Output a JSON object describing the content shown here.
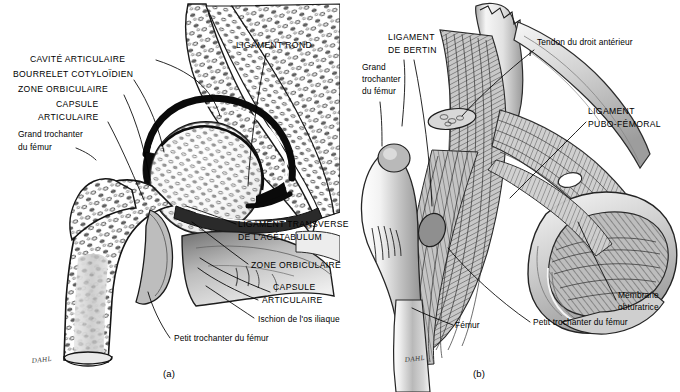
{
  "figure": {
    "background_color": "#ffffff",
    "ink_color": "#000000",
    "style": "grayscale medical line illustration, stipple and hatch shading",
    "signature": "DAHL"
  },
  "panels": [
    {
      "id": "a",
      "letter": "(a)",
      "view": "frontal cross-section of the hip joint (coxo-femoral articulation)",
      "labels": [
        {
          "name": "cavite-articulaire",
          "text": "CAVITÉ ARTICULAIRE",
          "style": "caps",
          "x": 30,
          "y": 62,
          "anchor": "start"
        },
        {
          "name": "bourrelet-cotyloidien",
          "text": "BOURRELET COTYLOÏDIEN",
          "style": "caps",
          "x": 13,
          "y": 77,
          "anchor": "start"
        },
        {
          "name": "zone-orbiculaire-left",
          "text": "ZONE ORBICULAIRE",
          "style": "caps",
          "x": 18,
          "y": 92,
          "anchor": "start"
        },
        {
          "name": "capsule-left-line1",
          "text": "CAPSULE",
          "style": "caps",
          "x": 56,
          "y": 107,
          "anchor": "start"
        },
        {
          "name": "capsule-left-line2",
          "text": "ARTICULAIRE",
          "style": "caps",
          "x": 38,
          "y": 120,
          "anchor": "start"
        },
        {
          "name": "grand-trochanter-left-line1",
          "text": "Grand trochanter",
          "style": "small",
          "x": 18,
          "y": 137,
          "anchor": "start"
        },
        {
          "name": "grand-trochanter-left-line2",
          "text": "du fémur",
          "style": "small",
          "x": 18,
          "y": 150,
          "anchor": "start"
        },
        {
          "name": "ligament-rond",
          "text": "LIGAMENT ROND",
          "style": "caps",
          "x": 236,
          "y": 48,
          "anchor": "start"
        },
        {
          "name": "ligament-transverse-line1",
          "text": "LIGAMENT TRANSVERSE",
          "style": "caps",
          "x": 238,
          "y": 227,
          "anchor": "start"
        },
        {
          "name": "ligament-transverse-line2",
          "text": "DE L'ACÉTABULUM",
          "style": "caps",
          "x": 238,
          "y": 240,
          "anchor": "start"
        },
        {
          "name": "zone-orbiculaire-lower",
          "text": "ZONE ORBICULAIRE",
          "style": "caps",
          "x": 251,
          "y": 268,
          "anchor": "start"
        },
        {
          "name": "capsule-lower-line1",
          "text": "CAPSULE",
          "style": "caps",
          "x": 273,
          "y": 290,
          "anchor": "start"
        },
        {
          "name": "capsule-lower-line2",
          "text": "ARTICULAIRE",
          "style": "caps",
          "x": 262,
          "y": 303,
          "anchor": "start"
        },
        {
          "name": "ischion-os-iliaque",
          "text": "Ischion de l'os iliaque",
          "style": "small",
          "x": 258,
          "y": 322,
          "anchor": "start"
        },
        {
          "name": "petit-trochanter-left",
          "text": "Petit trochanter du fémur",
          "style": "small",
          "x": 174,
          "y": 341,
          "anchor": "start"
        }
      ]
    },
    {
      "id": "b",
      "letter": "(b)",
      "view": "anterior view of the hip ligaments",
      "labels": [
        {
          "name": "ligament-de-bertin-line1",
          "text": "LIGAMENT",
          "style": "caps",
          "x": 388,
          "y": 40,
          "anchor": "start"
        },
        {
          "name": "ligament-de-bertin-line2",
          "text": "DE BERTIN",
          "style": "caps",
          "x": 388,
          "y": 53,
          "anchor": "start"
        },
        {
          "name": "grand-trochanter-right-line1",
          "text": "Grand",
          "style": "small",
          "x": 362,
          "y": 70,
          "anchor": "start"
        },
        {
          "name": "grand-trochanter-right-line2",
          "text": "trochanter",
          "style": "small",
          "x": 362,
          "y": 82,
          "anchor": "start"
        },
        {
          "name": "grand-trochanter-right-line3",
          "text": "du fémur",
          "style": "small",
          "x": 362,
          "y": 94,
          "anchor": "start"
        },
        {
          "name": "tendon-droit-anterieur",
          "text": "Tendon du droit antérieur",
          "style": "small",
          "x": 537,
          "y": 45,
          "anchor": "start"
        },
        {
          "name": "ligament-pubo-femoral-line1",
          "text": "LIGAMENT",
          "style": "caps",
          "x": 588,
          "y": 114,
          "anchor": "start"
        },
        {
          "name": "ligament-pubo-femoral-line2",
          "text": "PUBO-FÉMORAL",
          "style": "caps",
          "x": 588,
          "y": 127,
          "anchor": "start"
        },
        {
          "name": "membrane-obturatrice-line1",
          "text": "Membrane",
          "style": "small",
          "x": 618,
          "y": 298,
          "anchor": "start"
        },
        {
          "name": "membrane-obturatrice-line2",
          "text": "obturatrice",
          "style": "small",
          "x": 618,
          "y": 310,
          "anchor": "start"
        },
        {
          "name": "femur-right",
          "text": "Fémur",
          "style": "small",
          "x": 455,
          "y": 328,
          "anchor": "start"
        },
        {
          "name": "petit-trochanter-right",
          "text": "Petit trochanter du fémur",
          "style": "small",
          "x": 533,
          "y": 325,
          "anchor": "start"
        }
      ]
    }
  ]
}
